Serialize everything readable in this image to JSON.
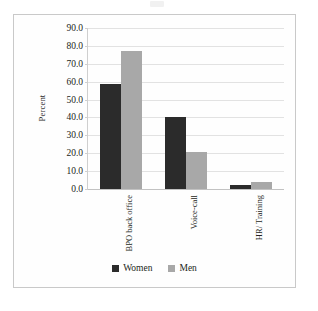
{
  "figure": {
    "background": "#ffffff",
    "frame_border_color": "#c9c9c9"
  },
  "chart_data": {
    "type": "bar",
    "title": "",
    "xlabel": "",
    "ylabel": "Percent",
    "categories": [
      "BPO back office",
      "Voice-call",
      "HR/ Training"
    ],
    "series": [
      {
        "name": "Women",
        "color": "#2b2b2b",
        "values": [
          58.8,
          40.5,
          2.0
        ]
      },
      {
        "name": "Men",
        "color": "#a8a8a8",
        "values": [
          77.2,
          20.8,
          4.2
        ]
      }
    ],
    "ylim": [
      0.0,
      90.0
    ],
    "ytick_step": 10.0,
    "ytick_labels": [
      "90.0",
      "80.0",
      "70.0",
      "60.0",
      "50.0",
      "40.0",
      "30.0",
      "20.0",
      "10.0",
      "0.0"
    ],
    "ytick_values": [
      90.0,
      80.0,
      70.0,
      60.0,
      50.0,
      40.0,
      30.0,
      20.0,
      10.0,
      0.0
    ],
    "grid": true,
    "grid_color": "#e2e2e2",
    "legend_position": "bottom",
    "legend": [
      {
        "label": "Women",
        "color": "#2b2b2b"
      },
      {
        "label": "Men",
        "color": "#a8a8a8"
      }
    ]
  }
}
